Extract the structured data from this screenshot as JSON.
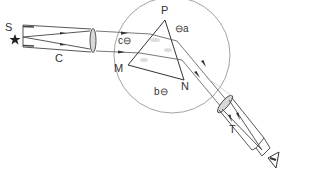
{
  "diagram": {
    "labels": {
      "source": "S",
      "collimator": "C",
      "apex": "P",
      "vertex_left": "M",
      "vertex_right": "N",
      "telescope": "T",
      "screw_a": "⊖a",
      "screw_b": "b⊖",
      "screw_c": "c⊖"
    },
    "colors": {
      "line": "#444444",
      "circle": "#888888",
      "background": "#ffffff"
    }
  }
}
